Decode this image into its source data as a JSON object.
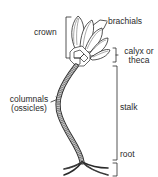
{
  "labels": {
    "crown": "crown",
    "brachials": "brachials",
    "calyx_line1": "calyx or",
    "calyx_line2": "theca",
    "columnals_line1": "columnals",
    "columnals_line2": "(ossicles)",
    "stalk": "stalk",
    "root": "root"
  },
  "colors": {
    "line": "#2a2a2a",
    "fill": "#ffffff",
    "shade": "#9a9a9a"
  }
}
